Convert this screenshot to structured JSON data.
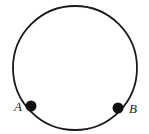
{
  "figure": {
    "background_color": "#ffffff",
    "stroke_color": "#1a1a1a",
    "point_color": "#111111",
    "label_color": "#1a1a1a",
    "circle": {
      "name": "circle-outline",
      "center_x": 75,
      "center_y": 68,
      "radius": 62,
      "stroke_width": 1.8,
      "fill": "none"
    },
    "points": [
      {
        "id": "point-a",
        "label": "A",
        "cx": 31,
        "cy": 106,
        "r": 5.5,
        "label_x": 18,
        "label_y": 111,
        "label_anchor": "middle"
      },
      {
        "id": "point-b",
        "label": "B",
        "cx": 118,
        "cy": 108,
        "r": 5.5,
        "label_x": 133,
        "label_y": 113,
        "label_anchor": "middle"
      }
    ]
  }
}
